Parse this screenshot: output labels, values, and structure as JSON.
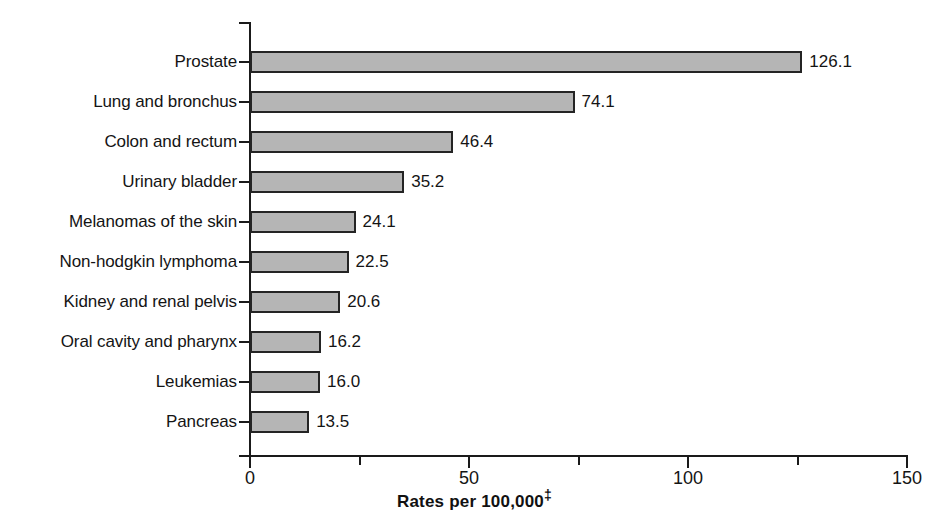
{
  "chart_data": {
    "type": "bar",
    "orientation": "horizontal",
    "title": "",
    "xlabel": "Rates per 100,000‡",
    "ylabel": "",
    "xlim": [
      0,
      150
    ],
    "grid": false,
    "legend": null,
    "categories": [
      "Prostate",
      "Lung and bronchus",
      "Colon and rectum",
      "Urinary bladder",
      "Melanomas of the skin",
      "Non-hodgkin lymphoma",
      "Kidney and renal pelvis",
      "Oral cavity and pharynx",
      "Leukemias",
      "Pancreas"
    ],
    "values": [
      126.1,
      74.1,
      46.4,
      35.2,
      24.1,
      22.5,
      20.6,
      16.2,
      16.0,
      13.5
    ],
    "value_labels": [
      "126.1",
      "74.1",
      "46.4",
      "35.2",
      "24.1",
      "22.5",
      "20.6",
      "16.2",
      "16.0",
      "13.5"
    ],
    "x_major_ticks": [
      0,
      50,
      100,
      150
    ],
    "x_major_tick_labels": [
      "0",
      "50",
      "100",
      "150"
    ],
    "x_minor_ticks": [
      25,
      75,
      125
    ],
    "bar_fill_color": "#b5b5b5",
    "bar_edge_color": "#242424",
    "axis_color": "#1a1a1a",
    "text_color": "#141414",
    "background_color": "#ffffff",
    "footnote_marker": "‡"
  }
}
